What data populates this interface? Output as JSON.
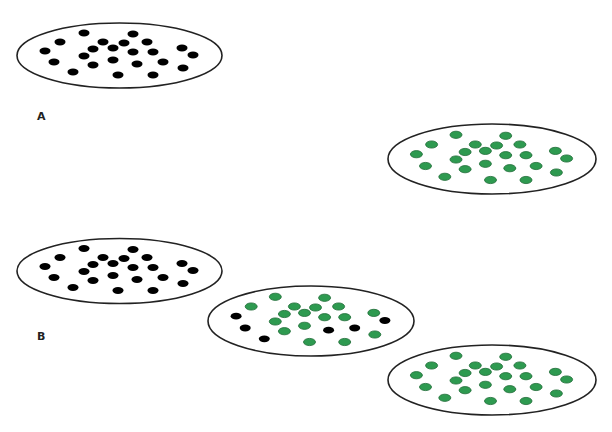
{
  "figure": {
    "labels": {
      "a": "A",
      "b": "B"
    },
    "colors": {
      "black_dot": "#000000",
      "green_dot": "#2e9a50",
      "green_stroke": "#1e6b36",
      "outline": "#222222"
    },
    "dot_pattern": [
      [
        -35.5,
        -22.5
      ],
      [
        13.5,
        -21.5
      ],
      [
        -59.5,
        -13.5
      ],
      [
        -16.5,
        -13.5
      ],
      [
        4.5,
        -12.5
      ],
      [
        27.5,
        -13.5
      ],
      [
        -74.5,
        -4.5
      ],
      [
        -26.5,
        -6.5
      ],
      [
        -6.5,
        -7.5
      ],
      [
        13.5,
        -3.5
      ],
      [
        33.5,
        -3.5
      ],
      [
        62.5,
        -7.5
      ],
      [
        -65.5,
        6.5
      ],
      [
        -35.5,
        0.5
      ],
      [
        -6.5,
        4.5
      ],
      [
        73.5,
        -0.5
      ],
      [
        -26.5,
        9.5
      ],
      [
        17.5,
        8.5
      ],
      [
        43.5,
        6.5
      ],
      [
        -46.5,
        16.5
      ],
      [
        63.5,
        12.5
      ],
      [
        -1.5,
        19.5
      ],
      [
        33.5,
        19.5
      ]
    ],
    "ellipses": [
      {
        "id": "A-before",
        "panel": "A",
        "cx": 119.5,
        "cy": 55.5,
        "rx": 102.5,
        "ry": 32.5,
        "state": "all-black"
      },
      {
        "id": "A-after",
        "panel": "A",
        "cx": 492,
        "cy": 159,
        "rx": 104,
        "ry": 35,
        "state": "all-green"
      },
      {
        "id": "B-before",
        "panel": "B",
        "cx": 119.5,
        "cy": 271,
        "rx": 102.5,
        "ry": 32.5,
        "state": "all-black"
      },
      {
        "id": "B-middle",
        "panel": "B",
        "cx": 311,
        "cy": 321,
        "rx": 103,
        "ry": 35,
        "state": "mixed",
        "black_indices": [
          6,
          12,
          15,
          17,
          18,
          19
        ]
      },
      {
        "id": "B-after",
        "panel": "B",
        "cx": 492,
        "cy": 380,
        "rx": 104,
        "ry": 35,
        "state": "all-green"
      }
    ]
  }
}
